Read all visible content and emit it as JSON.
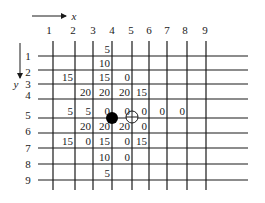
{
  "diagram": {
    "axis_x": {
      "label": "x",
      "arrow": {
        "x1": 32,
        "x2": 66,
        "y": 16
      },
      "label_pos": [
        74,
        16
      ]
    },
    "axis_y": {
      "label": "y",
      "arrow": {
        "x": 20,
        "y1": 43,
        "y2": 78
      },
      "label_pos": [
        16,
        84
      ]
    },
    "columns": [
      {
        "label": "1",
        "x": 53,
        "label_x": 49
      },
      {
        "label": "2",
        "x": 75,
        "label_x": 73
      },
      {
        "label": "3",
        "x": 93,
        "label_x": 93
      },
      {
        "label": "4",
        "x": 112,
        "label_x": 112
      },
      {
        "label": "5",
        "x": 132,
        "label_x": 131
      },
      {
        "label": "6",
        "x": 149,
        "label_x": 149
      },
      {
        "label": "7",
        "x": 167,
        "label_x": 167
      },
      {
        "label": "8",
        "x": 187,
        "label_x": 185
      },
      {
        "label": "9",
        "x": 206,
        "label_x": 205
      }
    ],
    "rows": [
      {
        "label": "1",
        "y": 56,
        "label_y": 56
      },
      {
        "label": "2",
        "y": 70,
        "label_y": 72
      },
      {
        "label": "3",
        "y": 84,
        "label_y": 84
      },
      {
        "label": "4",
        "y": 99,
        "label_y": 95
      },
      {
        "label": "5",
        "y": 118,
        "label_y": 115
      },
      {
        "label": "6",
        "y": 133,
        "label_y": 131
      },
      {
        "label": "7",
        "y": 148,
        "label_y": 148
      },
      {
        "label": "8",
        "y": 164,
        "label_y": 164
      },
      {
        "label": "9",
        "y": 180,
        "label_y": 180
      }
    ],
    "grid": {
      "h_x1": 38,
      "h_x2": 248,
      "v_y1": 41,
      "v_y2": 190,
      "color": "#1a1a1a"
    },
    "values": [
      {
        "col": 4,
        "row": 1,
        "text": "5"
      },
      {
        "col": 4,
        "row": 2,
        "text": "10"
      },
      {
        "col": 2,
        "row": 3,
        "text": "15"
      },
      {
        "col": 4,
        "row": 3,
        "text": "15"
      },
      {
        "col": 5,
        "row": 3,
        "text": "0"
      },
      {
        "col": 3,
        "row": 4,
        "text": "20"
      },
      {
        "col": 4,
        "row": 4,
        "text": "20"
      },
      {
        "col": 5,
        "row": 4,
        "text": "20"
      },
      {
        "col": 6,
        "row": 4,
        "text": "15"
      },
      {
        "col": 2,
        "row": 5,
        "text": "5"
      },
      {
        "col": 3,
        "row": 5,
        "text": "5"
      },
      {
        "col": 4,
        "row": 5,
        "text": "0"
      },
      {
        "col": 5,
        "row": 5,
        "text": "0"
      },
      {
        "col": 6,
        "row": 5,
        "text": "0"
      },
      {
        "col": 7,
        "row": 5,
        "text": "0"
      },
      {
        "col": 8,
        "row": 5,
        "text": "0"
      },
      {
        "col": 3,
        "row": 6,
        "text": "20"
      },
      {
        "col": 4,
        "row": 6,
        "text": "20"
      },
      {
        "col": 5,
        "row": 6,
        "text": "20"
      },
      {
        "col": 6,
        "row": 6,
        "text": "0"
      },
      {
        "col": 2,
        "row": 7,
        "text": "15"
      },
      {
        "col": 3,
        "row": 7,
        "text": "0"
      },
      {
        "col": 4,
        "row": 7,
        "text": "15"
      },
      {
        "col": 5,
        "row": 7,
        "text": "0"
      },
      {
        "col": 6,
        "row": 7,
        "text": "15"
      },
      {
        "col": 4,
        "row": 8,
        "text": "10"
      },
      {
        "col": 5,
        "row": 8,
        "text": "0"
      },
      {
        "col": 4,
        "row": 9,
        "text": "5"
      }
    ],
    "markers": [
      {
        "type": "filled-circle",
        "cx": 112,
        "cy": 118,
        "r": 6
      },
      {
        "type": "crosshair-circle",
        "cx": 132,
        "cy": 117,
        "r": 6
      }
    ]
  }
}
